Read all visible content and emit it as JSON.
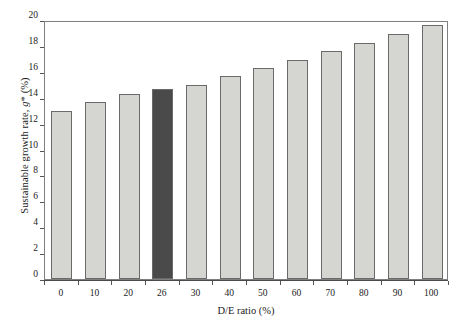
{
  "chart_data": {
    "type": "bar",
    "title": "",
    "subtitle": "",
    "xlabel": "D/E ratio (%)",
    "ylabel": "Sustainable growth rate, g* (%)",
    "categories": [
      "0",
      "10",
      "20",
      "26",
      "30",
      "40",
      "50",
      "60",
      "70",
      "80",
      "90",
      "100"
    ],
    "values": [
      13.0,
      13.65,
      14.3,
      14.7,
      15.0,
      15.65,
      16.3,
      16.95,
      17.6,
      18.25,
      18.9,
      19.6
    ],
    "highlight_index": 3,
    "series": [
      {
        "name": "Sustainable growth rate",
        "values": [
          13.0,
          13.65,
          14.3,
          14.7,
          15.0,
          15.65,
          16.3,
          16.95,
          17.6,
          18.25,
          18.9,
          19.6
        ]
      }
    ],
    "ylim": [
      0,
      20
    ],
    "ytick_values": [
      20,
      18,
      16,
      14,
      12,
      10,
      8,
      6,
      4,
      2,
      0
    ],
    "ytick_labels": [
      "20",
      "18",
      "16",
      "14",
      "12",
      "10",
      "8",
      "6",
      "4",
      "2",
      "0"
    ],
    "xtick_labels": [
      "0",
      "10",
      "20",
      "26",
      "30",
      "40",
      "50",
      "60",
      "70",
      "80",
      "90",
      "100"
    ],
    "grid": false,
    "legend": false,
    "legend_position": "none",
    "colors": {
      "bar_fill": "#d5d5d2",
      "bar_highlight_fill": "#4a4a4a",
      "bar_border": "#6a6a6a",
      "axis": "#4a4a4a",
      "frame": "#7f7f7f",
      "text": "#1a1a1a",
      "background": "#ffffff"
    }
  }
}
